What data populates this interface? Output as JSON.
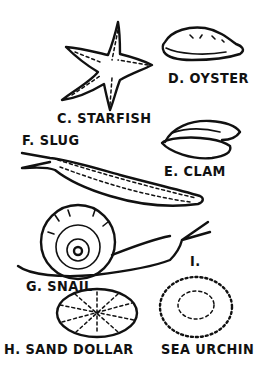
{
  "diagram": {
    "background": "#ffffff",
    "ink_color": "#111111",
    "items": [
      {
        "id": "C",
        "name": "STARFISH",
        "label": "C. STARFISH"
      },
      {
        "id": "D",
        "name": "OYSTER",
        "label": "D. OYSTER"
      },
      {
        "id": "E",
        "name": "CLAM",
        "label": "E. CLAM"
      },
      {
        "id": "F",
        "name": "SLUG",
        "label": "F. SLUG"
      },
      {
        "id": "G",
        "name": "SNAIL",
        "label": "G. SNAIL"
      },
      {
        "id": "H",
        "name": "SAND DOLLAR",
        "label": "H. SAND DOLLAR"
      },
      {
        "id": "I",
        "name": "SEA URCHIN",
        "label_letter": "I.",
        "label": "SEA URCHIN"
      }
    ]
  }
}
